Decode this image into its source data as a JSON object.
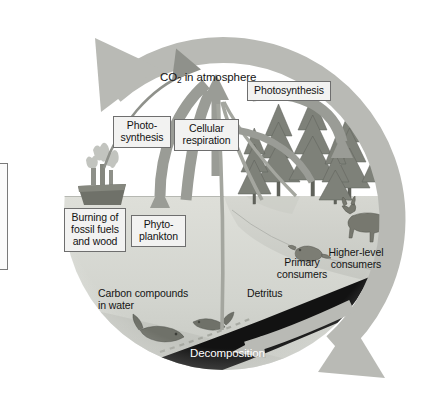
{
  "diagram": {
    "type": "cycle-diagram",
    "colors": {
      "cycle_arrow": "#b9bab5",
      "process_arrow": "#9a9c96",
      "sky": "#ffffff",
      "water": "#d6d8d2",
      "deep_water": "#c2c4be",
      "land": "#cfd0ca",
      "detritus_band": "#111111",
      "label_box_fill": "#f2f2f1",
      "label_box_border": "#6e6e6e",
      "text": "#131313",
      "text_inverse": "#ffffff"
    }
  },
  "labels": {
    "co2_atmosphere": "CO₂ in atmosphere",
    "photosynthesis_right": "Photosynthesis",
    "photosynthesis_left": "Photo-\nsynthesis",
    "cellular_respiration": "Cellular\nrespiration",
    "burning": "Burning of\nfossil fuels\nand wood",
    "phytoplankton": "Phyto-\nplankton",
    "primary_consumers": "Primary\nconsumers",
    "higher_level_consumers": "Higher-level\nconsumers",
    "carbon_compounds": "Carbon compounds\nin water",
    "detritus": "Detritus",
    "decomposition": "Decomposition"
  },
  "boxed_labels": [
    "Photosynthesis",
    "Photo-synthesis",
    "Cellular respiration",
    "Burning of fossil fuels and wood",
    "Phyto-plankton"
  ],
  "plain_labels": [
    "CO₂ in atmosphere",
    "Primary consumers",
    "Higher-level consumers",
    "Carbon compounds in water",
    "Detritus",
    "Decomposition"
  ],
  "scene": {
    "ship": "ship-with-smokestacks",
    "forest": "conifer-forest",
    "animals": [
      "rodent-primary-consumer",
      "deer-higher-level-consumer",
      "wolf-higher-level-consumer"
    ],
    "fish": [
      "fish-large",
      "fish-small"
    ],
    "water_surface_y": 196,
    "detritus_band": "dark-sediment-band"
  },
  "flows": [
    {
      "name": "photosynthesis-ocean",
      "from": "CO₂ in atmosphere",
      "to": "Phyto-plankton",
      "direction": "down"
    },
    {
      "name": "cellular-respiration-ocean",
      "from": "Phyto-plankton",
      "to": "CO₂ in atmosphere",
      "direction": "up"
    },
    {
      "name": "burning-fossil-fuels",
      "from": "Burning of fossil fuels and wood",
      "to": "CO₂ in atmosphere",
      "direction": "up"
    },
    {
      "name": "photosynthesis-forest",
      "from": "CO₂ in atmosphere",
      "to": "forest",
      "direction": "down"
    },
    {
      "name": "cellular-respiration-forest",
      "from": "forest",
      "to": "CO₂ in atmosphere",
      "direction": "up"
    },
    {
      "name": "decomposition",
      "from": "Detritus",
      "to": "Carbon compounds in water",
      "direction": "left"
    },
    {
      "name": "cycle",
      "from": "land",
      "to": "ocean",
      "direction": "clockwise"
    }
  ]
}
